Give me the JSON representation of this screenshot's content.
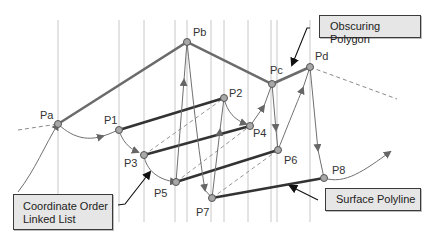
{
  "callouts": {
    "obscuring_polygon": "Obscuring Polygon",
    "linked_list_line1": "Coordinate Order",
    "linked_list_line2": "Linked List",
    "surface_polyline": "Surface Polyline"
  },
  "points": {
    "Pa": {
      "label": "Pa",
      "x": 58,
      "y": 124
    },
    "Pb": {
      "label": "Pb",
      "x": 187,
      "y": 42
    },
    "Pc": {
      "label": "Pc",
      "x": 272,
      "y": 84
    },
    "Pd": {
      "label": "Pd",
      "x": 310,
      "y": 67
    },
    "P1": {
      "label": "P1",
      "x": 119,
      "y": 130
    },
    "P2": {
      "label": "P2",
      "x": 224,
      "y": 98
    },
    "P3": {
      "label": "P3",
      "x": 144,
      "y": 155
    },
    "P4": {
      "label": "P4",
      "x": 250,
      "y": 126
    },
    "P5": {
      "label": "P5",
      "x": 176,
      "y": 182
    },
    "P6": {
      "label": "P6",
      "x": 278,
      "y": 150
    },
    "P7": {
      "label": "P7",
      "x": 212,
      "y": 198
    },
    "P8": {
      "label": "P8",
      "x": 324,
      "y": 178
    }
  },
  "colors": {
    "polygon": "#6b6b6b",
    "polyline": "#333333",
    "grid": "#c8c8c8",
    "arrow": "#707070",
    "point_fill": "#a8a8a8",
    "callout_bg": "#e6e6e6"
  }
}
